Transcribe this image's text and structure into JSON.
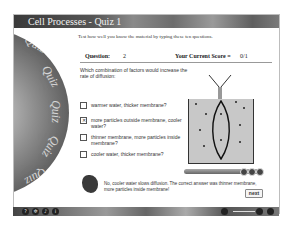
{
  "window": {
    "title": "Cell Processes - Quiz 1"
  },
  "decoration": {
    "disc_words": [
      "Quiz",
      "Quiz",
      "Quiz",
      "Quiz",
      "Quiz"
    ]
  },
  "intro": "Test how well you know the material by typing these ten questions.",
  "question_bar": {
    "question_label": "Question:",
    "question_number": "2",
    "score_label": "Your Current Score =",
    "score_value": "0/1"
  },
  "question": {
    "text": "Which combination of factors would increase the rate of diffusion:",
    "options": [
      {
        "label": "warmer water, thicker membrane?",
        "checked": false
      },
      {
        "label": "more particles outside membrane, cooler water?",
        "checked": true
      },
      {
        "label": "thinner membrane, more particles inside membrane?",
        "checked": false
      },
      {
        "label": "cooler water, thicker membrane?",
        "checked": false
      }
    ]
  },
  "feedback": {
    "text": "No, cooler water slows diffusion. The correct answer was thinner membrane, more particles inside membrane!"
  },
  "buttons": {
    "next": "next"
  },
  "bottom_bar": {
    "icons": [
      "help-icon",
      "settings-icon",
      "audio-icon",
      "info-icon"
    ],
    "icon_glyphs": [
      "?",
      "✲",
      "♪",
      "i"
    ],
    "right_icons": [
      "volume-icon",
      "back-icon",
      "forward-icon"
    ]
  }
}
